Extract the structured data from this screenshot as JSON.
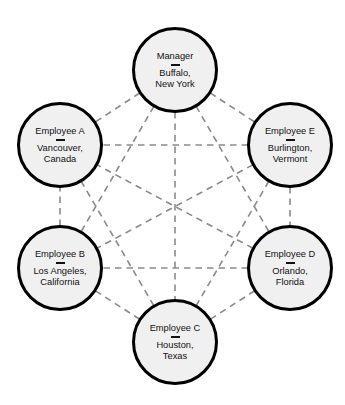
{
  "diagram": {
    "background_color": "#ffffff",
    "node_fill_color": "#f0f0f0",
    "node_border_color": "#000000",
    "edge_color": "#8a8a8a",
    "edge_style": "dashed",
    "node_radius": 43,
    "edge_count": 15,
    "nodes": [
      {
        "id": "manager",
        "title": "Manager",
        "separator": "—",
        "location": "Buffalo,\nNew York",
        "cx": 175,
        "cy": 70
      },
      {
        "id": "employee-e",
        "title": "Employee E",
        "separator": "—",
        "location": "Burlington,\nVermont",
        "cx": 290,
        "cy": 145
      },
      {
        "id": "employee-d",
        "title": "Employee D",
        "separator": "—",
        "location": "Orlando,\nFlorida",
        "cx": 290,
        "cy": 268
      },
      {
        "id": "employee-c",
        "title": "Employee C",
        "separator": "—",
        "location": "Houston,\nTexas",
        "cx": 175,
        "cy": 342
      },
      {
        "id": "employee-b",
        "title": "Employee B",
        "separator": "—",
        "location": "Los Angeles,\nCalifornia",
        "cx": 60,
        "cy": 268
      },
      {
        "id": "employee-a",
        "title": "Employee A",
        "separator": "—",
        "location": "Vancouver,\nCanada",
        "cx": 60,
        "cy": 145
      }
    ],
    "edges": [
      {
        "from": "manager",
        "to": "employee-e"
      },
      {
        "from": "manager",
        "to": "employee-d"
      },
      {
        "from": "manager",
        "to": "employee-c"
      },
      {
        "from": "manager",
        "to": "employee-b"
      },
      {
        "from": "manager",
        "to": "employee-a"
      },
      {
        "from": "employee-e",
        "to": "employee-d"
      },
      {
        "from": "employee-e",
        "to": "employee-c"
      },
      {
        "from": "employee-e",
        "to": "employee-b"
      },
      {
        "from": "employee-e",
        "to": "employee-a"
      },
      {
        "from": "employee-d",
        "to": "employee-c"
      },
      {
        "from": "employee-d",
        "to": "employee-b"
      },
      {
        "from": "employee-d",
        "to": "employee-a"
      },
      {
        "from": "employee-c",
        "to": "employee-b"
      },
      {
        "from": "employee-c",
        "to": "employee-a"
      },
      {
        "from": "employee-b",
        "to": "employee-a"
      }
    ]
  }
}
